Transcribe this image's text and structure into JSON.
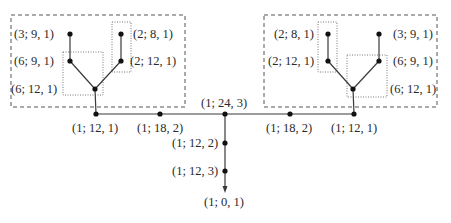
{
  "colors": {
    "line": "#3a3a3a",
    "node": "#111111",
    "dashed_box": "#555555",
    "dotted_box": "#777777",
    "text": "#2a2a2a"
  },
  "left_tree": {
    "nodes": [
      {
        "id": "L-a",
        "label": "(3; 9, 1)",
        "x": 70,
        "y": 34
      },
      {
        "id": "L-b",
        "label": "(6; 9, 1)",
        "x": 70,
        "y": 61
      },
      {
        "id": "L-root",
        "label": "(6; 12, 1)",
        "x": 95,
        "y": 89
      },
      {
        "id": "L-c",
        "label": "(2; 8, 1)",
        "x": 121,
        "y": 34
      },
      {
        "id": "L-d",
        "label": "(2; 12, 1)",
        "x": 121,
        "y": 61
      }
    ]
  },
  "right_tree": {
    "nodes": [
      {
        "id": "R-c",
        "label": "(2; 8, 1)",
        "x": 328,
        "y": 34
      },
      {
        "id": "R-d",
        "label": "(2; 12, 1)",
        "x": 328,
        "y": 61
      },
      {
        "id": "R-root",
        "label": "(6; 12, 1)",
        "x": 353,
        "y": 89
      },
      {
        "id": "R-a",
        "label": "(3; 9, 1)",
        "x": 379,
        "y": 34
      },
      {
        "id": "R-b",
        "label": "(6; 9, 1)",
        "x": 379,
        "y": 61
      }
    ]
  },
  "main_line": {
    "nodes": [
      {
        "id": "M1",
        "label": "(1; 12, 1)",
        "x": 96,
        "y": 114
      },
      {
        "id": "M2",
        "label": "(1; 18, 2)",
        "x": 160,
        "y": 114
      },
      {
        "id": "M3",
        "label": "(1; 24, 3)",
        "x": 225,
        "y": 114
      },
      {
        "id": "M4",
        "label": "(1; 18, 2)",
        "x": 290,
        "y": 114
      },
      {
        "id": "M5",
        "label": "(1; 12, 1)",
        "x": 354,
        "y": 114
      }
    ]
  },
  "stem": {
    "nodes": [
      {
        "id": "S1",
        "label": "(1; 12, 2)",
        "x": 225,
        "y": 143
      },
      {
        "id": "S2",
        "label": "(1; 12, 3)",
        "x": 225,
        "y": 171
      }
    ],
    "end_label": "(1; 0, 1)"
  }
}
